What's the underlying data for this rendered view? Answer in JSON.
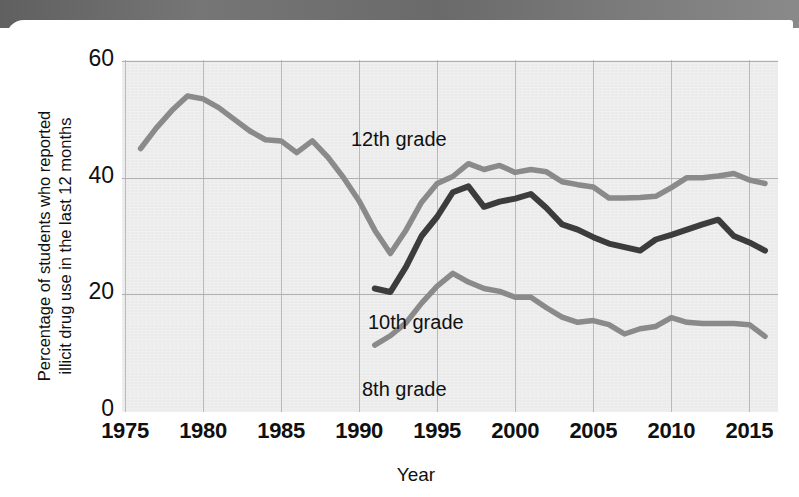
{
  "figure": {
    "ylabel": "Percentage of students who reported illicit drug use in the last 12 months",
    "ylabel_line1": "Percentage of students who reported",
    "ylabel_line2": "illicit drug use in the last 12 months",
    "xlabel": "Year"
  },
  "colors": {
    "plot_background": "#ebebeb",
    "grid": "#b5b5b5",
    "grade12": "#8a8a8a",
    "grade10": "#3c3c3c",
    "grade8": "#8a8a8a",
    "text": "#101010",
    "top_band": "#6f6f70"
  },
  "chart_data": {
    "type": "line",
    "title": "",
    "xlabel": "Year",
    "ylabel": "Percentage of students who reported illicit drug use in the last 12 months",
    "xlim": [
      1975,
      2016
    ],
    "ylim": [
      0,
      60
    ],
    "xticks": [
      1975,
      1980,
      1985,
      1990,
      1995,
      2000,
      2005,
      2010,
      2015
    ],
    "yticks": [
      0,
      20,
      40,
      60
    ],
    "grid": true,
    "legend": "inline-annotations",
    "annotations": [
      {
        "text": "12th grade",
        "x": 1982.5,
        "y": 55
      },
      {
        "text": "10th grade",
        "x": 1983.5,
        "y": 23
      },
      {
        "text": "8th grade",
        "x": 1983.5,
        "y": 12
      }
    ],
    "series": [
      {
        "name": "12th grade",
        "color": "#8a8a8a",
        "x": [
          1976,
          1977,
          1978,
          1979,
          1980,
          1981,
          1982,
          1983,
          1984,
          1985,
          1986,
          1987,
          1988,
          1989,
          1990,
          1991,
          1992,
          1993,
          1994,
          1995,
          1996,
          1997,
          1998,
          1999,
          2000,
          2001,
          2002,
          2003,
          2004,
          2005,
          2006,
          2007,
          2008,
          2009,
          2010,
          2011,
          2012,
          2013,
          2014,
          2015,
          2016
        ],
        "y": [
          45.0,
          48.5,
          51.5,
          54.0,
          53.5,
          52.0,
          50.0,
          48.0,
          46.5,
          46.3,
          44.3,
          46.3,
          43.5,
          40.0,
          36.0,
          31.0,
          27.0,
          31.0,
          35.8,
          39.0,
          40.2,
          42.4,
          41.4,
          42.1,
          40.9,
          41.4,
          41.0,
          39.3,
          38.8,
          38.4,
          36.5,
          36.5,
          36.6,
          36.8,
          38.3,
          40.0,
          40.0,
          40.3,
          40.7,
          39.6,
          39.0
        ]
      },
      {
        "name": "10th grade",
        "color": "#3c3c3c",
        "x": [
          1991,
          1992,
          1993,
          1994,
          1995,
          1996,
          1997,
          1998,
          1999,
          2000,
          2001,
          2002,
          2003,
          2004,
          2005,
          2006,
          2007,
          2008,
          2009,
          2010,
          2011,
          2012,
          2013,
          2014,
          2015,
          2016
        ],
        "y": [
          21.0,
          20.4,
          24.7,
          30.0,
          33.3,
          37.5,
          38.5,
          35.0,
          35.9,
          36.4,
          37.2,
          34.8,
          32.0,
          31.1,
          29.8,
          28.7,
          28.1,
          27.5,
          29.4,
          30.2,
          31.1,
          32.0,
          32.8,
          30.0,
          28.9,
          27.5
        ]
      },
      {
        "name": "8th grade",
        "color": "#8a8a8a",
        "x": [
          1991,
          1992,
          1993,
          1994,
          1995,
          1996,
          1997,
          1998,
          1999,
          2000,
          2001,
          2002,
          2003,
          2004,
          2005,
          2006,
          2007,
          2008,
          2009,
          2010,
          2011,
          2012,
          2013,
          2014,
          2015,
          2016
        ],
        "y": [
          11.3,
          12.9,
          15.1,
          18.5,
          21.4,
          23.6,
          22.1,
          21.0,
          20.5,
          19.5,
          19.5,
          17.7,
          16.1,
          15.2,
          15.5,
          14.8,
          13.2,
          14.1,
          14.5,
          16.0,
          15.2,
          15.0,
          15.0,
          15.0,
          14.8,
          12.8
        ]
      }
    ]
  }
}
